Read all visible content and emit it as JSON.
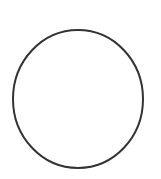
{
  "canvas": {
    "width": 161,
    "height": 179,
    "background_color": "#ffffff",
    "label": "drawing-canvas"
  },
  "figure": {
    "name": "circle-outline",
    "shape_type": "ellipse",
    "description": "Circle outline",
    "fill": "none",
    "stroke_color": "#333333",
    "stroke_width": 2,
    "center_x": 78,
    "center_y": 99,
    "radius_x": 65,
    "radius_y": 69,
    "bounds": {
      "left": 13,
      "top": 30,
      "right": 143,
      "bottom": 168,
      "width": 130,
      "height": 138
    }
  },
  "annotations": {
    "text_present": false,
    "items": []
  }
}
